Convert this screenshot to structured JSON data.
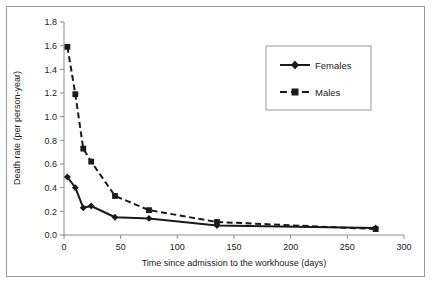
{
  "chart_data": {
    "type": "line",
    "title": "",
    "xlabel": "Time since admission to the workhouse (days)",
    "ylabel": "Death rate (per person-year)",
    "xlim": [
      0,
      300
    ],
    "ylim": [
      0.0,
      1.8
    ],
    "xticks": [
      "0",
      "50",
      "100",
      "150",
      "200",
      "250",
      "300"
    ],
    "xtick_values": [
      0,
      50,
      100,
      150,
      200,
      250,
      300
    ],
    "yticks": [
      "0.0",
      "0.2",
      "0.4",
      "0.6",
      "0.8",
      "1.0",
      "1.2",
      "1.4",
      "1.6",
      "1.8"
    ],
    "ytick_values": [
      0.0,
      0.2,
      0.4,
      0.6,
      0.8,
      1.0,
      1.2,
      1.4,
      1.6,
      1.8
    ],
    "grid": false,
    "legend_position": "upper right",
    "series": [
      {
        "name": "Females",
        "line_style": "solid",
        "marker": "diamond",
        "color": "#1a1a1a",
        "x": [
          3,
          10,
          17,
          24,
          45,
          75,
          135,
          275
        ],
        "values": [
          0.49,
          0.4,
          0.23,
          0.245,
          0.15,
          0.14,
          0.08,
          0.06
        ]
      },
      {
        "name": "Males",
        "line_style": "dashed",
        "marker": "square",
        "color": "#1a1a1a",
        "x": [
          3,
          10,
          17,
          24,
          45,
          75,
          135,
          275
        ],
        "values": [
          1.59,
          1.19,
          0.73,
          0.62,
          0.33,
          0.21,
          0.11,
          0.05
        ]
      }
    ]
  },
  "legend": {
    "entries": [
      {
        "label": "Females"
      },
      {
        "label": "Males"
      }
    ]
  },
  "colors": {
    "ink": "#1a1a1a",
    "axis": "#808080",
    "frame": "#9a9a9a",
    "background": "#ffffff"
  }
}
